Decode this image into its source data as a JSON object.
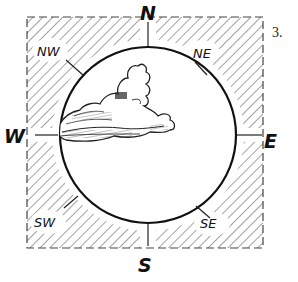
{
  "figure": {
    "number_label": "3."
  },
  "compass": {
    "cardinal": {
      "north": "N",
      "east": "E",
      "south": "S",
      "west": "W"
    },
    "intercardinal": {
      "northwest": "NW",
      "northeast": "NE",
      "southwest": "SW",
      "southeast": "SE"
    }
  },
  "sky_circle": {
    "cloud_position": "W",
    "cloud_coverage_side": "west / northwest"
  },
  "colors": {
    "ink": "#111111",
    "hatch": "#555555",
    "background": "#ffffff"
  }
}
